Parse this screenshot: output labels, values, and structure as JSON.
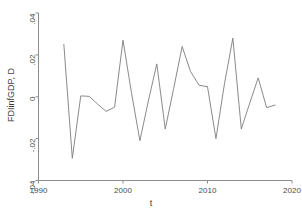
{
  "chart_data": {
    "type": "line",
    "title": "",
    "xlabel": "t",
    "ylabel": "FDIinfGDP, D",
    "xlim": [
      1990,
      2020
    ],
    "ylim": [
      -0.04,
      0.04
    ],
    "xticks": [
      1990,
      2000,
      2010,
      2020
    ],
    "xtick_labels": [
      "1990",
      "2000",
      "2010",
      "2020"
    ],
    "yticks": [
      0.04,
      0.02,
      0,
      -0.02,
      -0.04
    ],
    "ytick_labels": [
      ".04",
      ".02",
      "0",
      "-.02",
      "-.04"
    ],
    "grid": false,
    "legend": null,
    "line_color": "#7d7d7d",
    "x": [
      1993,
      1994,
      1995,
      1996,
      1997,
      1998,
      1999,
      2000,
      2001,
      2002,
      2003,
      2004,
      2005,
      2006,
      2007,
      2008,
      2009,
      2010,
      2011,
      2012,
      2013,
      2014,
      2015,
      2016,
      2017,
      2018
    ],
    "values": [
      0.025,
      -0.0294,
      0.0004,
      0.0002,
      -0.0035,
      -0.007,
      -0.005,
      0.027,
      0.002,
      -0.021,
      -0.002,
      0.0157,
      -0.0154,
      0.004,
      0.024,
      0.012,
      0.0055,
      0.0048,
      -0.02,
      0.006,
      0.028,
      -0.0154,
      -0.003,
      0.009,
      -0.0052,
      -0.004
    ],
    "series": [
      {
        "name": "FDIinfGDP, D",
        "values": [
          0.025,
          -0.0294,
          0.0004,
          0.0002,
          -0.0035,
          -0.007,
          -0.005,
          0.027,
          0.002,
          -0.021,
          -0.002,
          0.0157,
          -0.0154,
          0.004,
          0.024,
          0.012,
          0.0055,
          0.0048,
          -0.02,
          0.006,
          0.028,
          -0.0154,
          -0.003,
          0.009,
          -0.0052,
          -0.004
        ]
      }
    ]
  }
}
